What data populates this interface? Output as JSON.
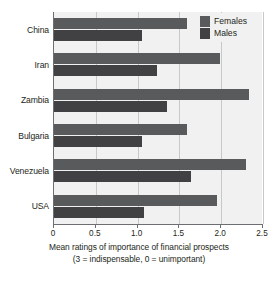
{
  "chart_data": {
    "type": "bar",
    "orientation": "horizontal",
    "title": "",
    "xlabel": "Mean ratings of importance of financial prospects (3 = indispensable, 0 = unimportant)",
    "xlabel_lines": [
      "Mean ratings of importance of financial prospects",
      "(3 = indispensable, 0 = unimportant)"
    ],
    "ylabel": "",
    "categories": [
      "China",
      "Iran",
      "Zambia",
      "Bulgaria",
      "Venezuela",
      "USA"
    ],
    "series": [
      {
        "name": "Females",
        "color": "#595a5c",
        "values": [
          1.59,
          1.98,
          2.33,
          1.59,
          2.3,
          1.95
        ]
      },
      {
        "name": "Males",
        "color": "#414042",
        "values": [
          1.05,
          1.23,
          1.35,
          1.05,
          1.64,
          1.08
        ]
      }
    ],
    "xlim": [
      0,
      2.5
    ],
    "xticks": [
      0,
      0.5,
      1.0,
      1.5,
      2.0,
      2.5
    ],
    "xtick_labels": [
      "0",
      "0.5",
      "1.0",
      "1.5",
      "2.0",
      "2.5"
    ],
    "grid": "vertical",
    "legend_position": "top-right",
    "legend_entries": [
      "Females",
      "Males"
    ]
  },
  "colors": {
    "females": "#595a5c",
    "males": "#414042",
    "plot_background": "#f1f1f1",
    "gridline": "#c7c8ca",
    "axis": "#6d6e71",
    "text": "#231f20"
  }
}
